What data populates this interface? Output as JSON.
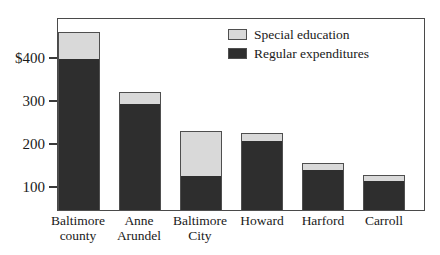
{
  "chart_data": {
    "type": "bar",
    "subtype": "stacked-vertical",
    "title": "",
    "xlabel": "",
    "ylabel": "",
    "categories": [
      "Baltimore county",
      "Anne Arundel",
      "Baltimore City",
      "Howard",
      "Harford",
      "Carroll"
    ],
    "category_lines": [
      [
        "Baltimore",
        "county"
      ],
      [
        "Anne",
        "Arundel"
      ],
      [
        "Baltimore",
        "City"
      ],
      [
        "Howard",
        ""
      ],
      [
        "Harford",
        ""
      ],
      [
        "Carroll",
        ""
      ]
    ],
    "series": [
      {
        "name": "Regular expenditures",
        "color": "#2e2e2e",
        "values": [
          400,
          295,
          125,
          208,
          140,
          115
        ]
      },
      {
        "name": "Special education",
        "color": "#d9d9d9",
        "values": [
          60,
          25,
          105,
          17,
          15,
          13
        ]
      }
    ],
    "totals": [
      460,
      320,
      230,
      225,
      155,
      128
    ],
    "ylim": [
      0,
      490
    ],
    "yticks": [
      100,
      200,
      300,
      400
    ],
    "ytick_labels": [
      "100",
      "200",
      "300",
      "400"
    ],
    "ytick_label_top": "$400",
    "y_unit_prefix": "$",
    "grid": false,
    "legend_position": "top-right",
    "legend": [
      {
        "label": "Special education",
        "color": "#d9d9d9"
      },
      {
        "label": "Regular expenditures",
        "color": "#2e2e2e"
      }
    ]
  },
  "axis": {
    "tick_400": "$400",
    "tick_300": "300",
    "tick_200": "200",
    "tick_100": "100"
  },
  "legend": {
    "special_label": "Special education",
    "regular_label": "Regular expenditures"
  },
  "categories": {
    "c0_line1": "Baltimore",
    "c0_line2": "county",
    "c1_line1": "Anne",
    "c1_line2": "Arundel",
    "c2_line1": "Baltimore",
    "c2_line2": "City",
    "c3_line1": "Howard",
    "c3_line2": "",
    "c4_line1": "Harford",
    "c4_line2": "",
    "c5_line1": "Carroll",
    "c5_line2": ""
  },
  "colors": {
    "special": "#d9d9d9",
    "regular": "#2e2e2e",
    "frame": "#4a4a4a",
    "background": "#ffffff"
  }
}
